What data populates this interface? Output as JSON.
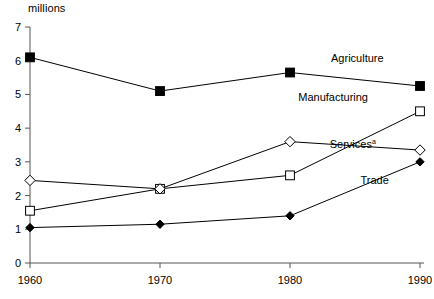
{
  "chart_data": {
    "type": "line",
    "title": "",
    "subtitle": "",
    "xlabel": "",
    "ylabel": "millions",
    "x": [
      1960,
      1970,
      1980,
      1990
    ],
    "xtick_labels": [
      "1960",
      "1970",
      "1980",
      "1990"
    ],
    "ytick_labels": [
      "0",
      "1",
      "2",
      "3",
      "4",
      "5",
      "6",
      "7"
    ],
    "ytick_values": [
      0,
      1,
      2,
      3,
      4,
      5,
      6,
      7
    ],
    "ylim": [
      0,
      7
    ],
    "xlim": [
      1960,
      1990
    ],
    "grid": false,
    "legend_position": "inline-right",
    "series": [
      {
        "name": "Agriculture",
        "label": "Agriculture",
        "marker": "filled-square",
        "color": "#000000",
        "values": [
          6.1,
          5.1,
          5.65,
          5.25
        ],
        "label_x": 1987.2,
        "label_y": 5.95
      },
      {
        "name": "Manufacturing",
        "label": "Manufacturing",
        "marker": "open-square",
        "color": "#000000",
        "values": [
          1.55,
          2.2,
          2.6,
          4.5
        ],
        "label_x": 1986.0,
        "label_y": 4.8
      },
      {
        "name": "Services",
        "label": "Services",
        "footnote_marker": "a",
        "marker": "open-diamond",
        "color": "#000000",
        "values": [
          2.45,
          2.2,
          3.6,
          3.35
        ],
        "label_x": 1986.6,
        "label_y": 3.4
      },
      {
        "name": "Trade",
        "label": "Trade",
        "marker": "filled-diamond",
        "color": "#000000",
        "values": [
          1.05,
          1.15,
          1.4,
          3.0
        ],
        "label_x": 1987.6,
        "label_y": 2.35
      }
    ]
  },
  "axes": {
    "y_title": "millions"
  }
}
